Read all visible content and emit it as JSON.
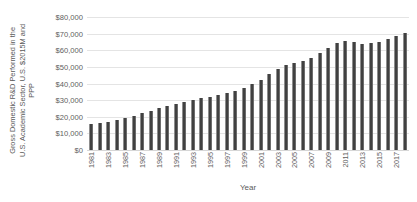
{
  "chart_data": {
    "type": "bar",
    "title": "",
    "ylabel": "Gross Domestic R&D Performed in the U.S. Academic Sector, U.S. $2015M and PPP",
    "ylabel_lines": [
      "Gross Domestic R&D Performed in the",
      "U.S. Academic Sector, U.S. $2015M and",
      "PPP"
    ],
    "xlabel": "Year",
    "ylim": [
      0,
      80000
    ],
    "ytick_values": [
      0,
      10000,
      20000,
      30000,
      40000,
      50000,
      60000,
      70000,
      80000
    ],
    "ytick_labels": [
      "$0",
      "$10,000",
      "$20,000",
      "$30,000",
      "$40,000",
      "$50,000",
      "$60,000",
      "$70,000",
      "$80,000"
    ],
    "grid": true,
    "legend": "none",
    "bar_color": "#414141",
    "categories": [
      "1981",
      "1982",
      "1983",
      "1984",
      "1985",
      "1986",
      "1987",
      "1988",
      "1989",
      "1990",
      "1991",
      "1992",
      "1993",
      "1994",
      "1995",
      "1996",
      "1997",
      "1998",
      "1999",
      "2000",
      "2001",
      "2002",
      "2003",
      "2004",
      "2005",
      "2006",
      "2007",
      "2008",
      "2009",
      "2010",
      "2011",
      "2012",
      "2013",
      "2014",
      "2015",
      "2016",
      "2017",
      "2018"
    ],
    "xtick_labels_shown": [
      "1981",
      "",
      "1983",
      "",
      "1985",
      "",
      "1987",
      "",
      "1989",
      "",
      "1991",
      "",
      "1993",
      "",
      "1995",
      "",
      "1997",
      "",
      "1999",
      "",
      "2001",
      "",
      "2003",
      "",
      "2005",
      "",
      "2007",
      "",
      "2009",
      "",
      "2011",
      "",
      "2013",
      "",
      "2015",
      "",
      "2017",
      ""
    ],
    "values": [
      15400,
      16000,
      16900,
      18000,
      19300,
      20400,
      22100,
      23700,
      25100,
      26600,
      27900,
      29000,
      30000,
      31100,
      32100,
      33000,
      34200,
      35700,
      37500,
      39700,
      42400,
      45600,
      48600,
      51000,
      52400,
      53700,
      55500,
      58100,
      61200,
      64500,
      65700,
      64900,
      63500,
      64300,
      65200,
      66600,
      68300,
      70200
    ]
  }
}
